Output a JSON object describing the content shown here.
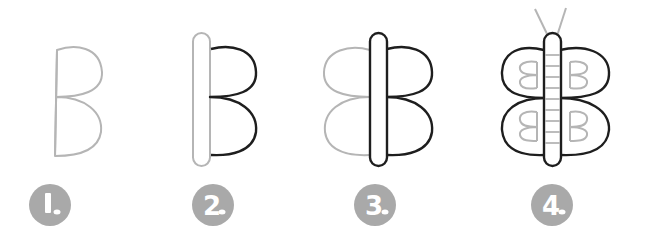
{
  "title": "How to draw a butterfly",
  "colors": {
    "guide_stroke": "#b5b5b5",
    "ink_stroke": "#1e1e1e",
    "badge_fill": "#a9a9a9",
    "badge_text": "#ffffff",
    "background": "#ffffff"
  },
  "steps": [
    {
      "number": "1",
      "label": "1.",
      "description": "Draw a B shape"
    },
    {
      "number": "2",
      "label": "2.",
      "description": "Add the body"
    },
    {
      "number": "3",
      "label": "3.",
      "description": "Mirror the wings"
    },
    {
      "number": "4",
      "label": "4.",
      "description": "Add antennae, stripes and B patterns"
    }
  ]
}
